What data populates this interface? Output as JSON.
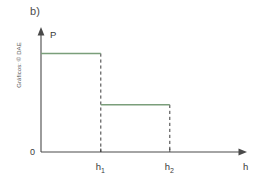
{
  "figure": {
    "panel_label": "b)",
    "credit": "Gráficos: © DAE",
    "background_color": "#ffffff"
  },
  "axes": {
    "y_axis_label": "P",
    "x_axis_label": "h",
    "origin_label": "0"
  },
  "ticks": {
    "x": [
      {
        "base": "h",
        "sub": "1"
      },
      {
        "base": "h",
        "sub": "2"
      }
    ]
  },
  "colors": {
    "step_green": "#7a9e7a",
    "axis": "#4a4a4a",
    "dashed": "#3b3b3b",
    "text": "#3a3a3a"
  },
  "chart_data": {
    "type": "line",
    "title": "b)",
    "xlabel": "h",
    "ylabel": "P",
    "grid": false,
    "legend": null,
    "xlim": [
      0,
      1
    ],
    "ylim": [
      0,
      1
    ],
    "x_tick_labels": [
      "h₁",
      "h₂"
    ],
    "x_tick_values": [
      0.325,
      0.7
    ],
    "y_tick_labels": [
      "0"
    ],
    "y_tick_values": [
      0
    ],
    "annotations": [
      "Gráficos: © DAE"
    ],
    "series": [
      {
        "name": "P(h)",
        "color": "#7a9e7a",
        "style": "step",
        "segments": [
          {
            "x_start": 0.0,
            "x_end": 0.325,
            "y": 0.835
          },
          {
            "x_start": 0.325,
            "x_end": 0.7,
            "y": 0.4
          }
        ],
        "x": [
          0.0,
          0.325,
          0.325,
          0.7
        ],
        "y": [
          0.835,
          0.835,
          0.4,
          0.4
        ]
      }
    ],
    "dashed_verticals": [
      {
        "x": 0.325,
        "y_top": 0.835,
        "y_bottom": 0.0
      },
      {
        "x": 0.7,
        "y_top": 0.4,
        "y_bottom": 0.0
      }
    ]
  }
}
